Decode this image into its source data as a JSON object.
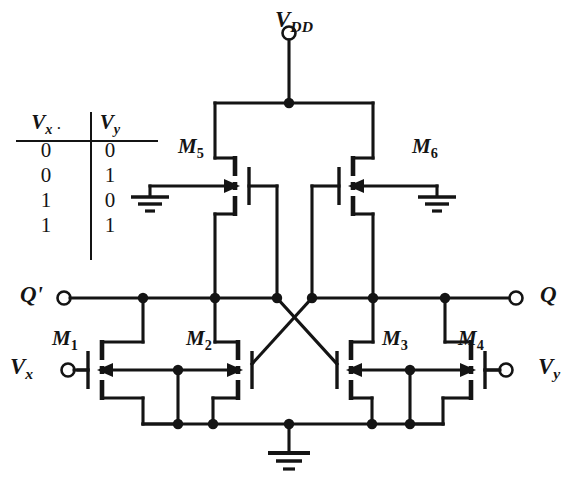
{
  "figure": {
    "kind": "cmos-circuit-schematic",
    "ink_color": "#141414",
    "background": "#ffffff"
  },
  "truth_table": {
    "headers": [
      "Vx",
      "Vy"
    ],
    "header_parts": [
      {
        "base": "V",
        "sub": "x"
      },
      {
        "base": "V",
        "sub": "y"
      }
    ],
    "rows": [
      [
        "0",
        "0"
      ],
      [
        "0",
        "1"
      ],
      [
        "1",
        "0"
      ],
      [
        "1",
        "1"
      ]
    ]
  },
  "supply": {
    "label_base": "V",
    "label_sub": "DD",
    "terminal": "open-circle"
  },
  "ports": [
    {
      "id": "q-bar",
      "label": "Q'",
      "side": "left",
      "x": 22,
      "y": 297
    },
    {
      "id": "q",
      "label": "Q",
      "side": "right",
      "x": 542,
      "y": 297
    },
    {
      "id": "vx",
      "label": "V",
      "sub": "x",
      "side": "left",
      "x": 12,
      "y": 368
    },
    {
      "id": "vy",
      "label": "V",
      "sub": "y",
      "side": "right",
      "x": 540,
      "y": 368
    }
  ],
  "devices": [
    {
      "id": "M1",
      "base": "M",
      "sub": "1",
      "type": "nmos",
      "label_x": 52,
      "label_y": 312
    },
    {
      "id": "M2",
      "base": "M",
      "sub": "2",
      "type": "nmos",
      "label_x": 186,
      "label_y": 312
    },
    {
      "id": "M3",
      "base": "M",
      "sub": "3",
      "type": "nmos",
      "label_x": 382,
      "label_y": 312
    },
    {
      "id": "M4",
      "base": "M",
      "sub": "4",
      "type": "nmos",
      "label_x": 458,
      "label_y": 312
    },
    {
      "id": "M5",
      "base": "M",
      "sub": "5",
      "type": "pmos",
      "label_x": 178,
      "label_y": 130
    },
    {
      "id": "M6",
      "base": "M",
      "sub": "6",
      "type": "pmos",
      "label_x": 412,
      "label_y": 130
    }
  ],
  "grounds": [
    {
      "id": "gnd-left",
      "x": 150,
      "y": 196
    },
    {
      "id": "gnd-right",
      "x": 437,
      "y": 196
    },
    {
      "id": "gnd-bottom",
      "x": 289,
      "y": 424
    }
  ],
  "nodes": {
    "vdd_bus_y": 103,
    "q_rail_y": 298,
    "source_rail_y": 424,
    "gate_rail_y": 370
  }
}
